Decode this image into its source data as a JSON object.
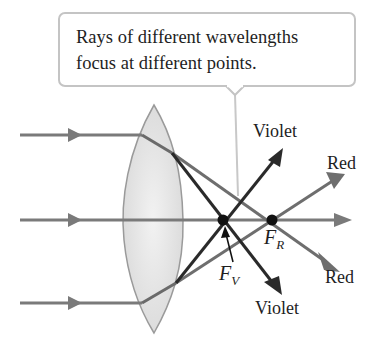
{
  "callout": {
    "line1": "Rays of different wavelengths",
    "line2": "focus at different points."
  },
  "labels": {
    "violet_top": "Violet",
    "violet_bottom": "Violet",
    "red_top": "Red",
    "red_bottom": "Red",
    "focal_violet_letter": "F",
    "focal_violet_sub": "V",
    "focal_red_letter": "F",
    "focal_red_sub": "R"
  },
  "colors": {
    "incident_ray": "#7a7a7a",
    "violet_ray": "#2a2a2a",
    "red_ray": "#6e6e6e",
    "lens_fill": "#e6e6e6",
    "callout_border": "#c4c4c4"
  }
}
